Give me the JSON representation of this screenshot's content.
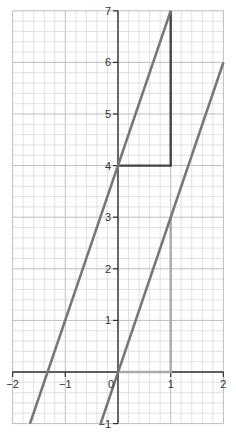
{
  "chart_data": {
    "type": "line",
    "title": "",
    "xlabel": "",
    "ylabel": "",
    "xlim": [
      -2,
      2
    ],
    "ylim": [
      -1,
      7
    ],
    "grid": true,
    "grid_minor_step": 0.2,
    "x_ticks": [
      -2,
      -1,
      0,
      1,
      2
    ],
    "x_tick_labels": [
      "-2",
      "-1",
      "0",
      "1",
      "2"
    ],
    "y_ticks": [
      -1,
      1,
      2,
      3,
      4,
      5,
      6,
      7
    ],
    "y_tick_labels": [
      "-1",
      "1",
      "2",
      "3",
      "4",
      "5",
      "6",
      "7"
    ],
    "series": [
      {
        "name": "y = 3x + 4",
        "slope": 3,
        "intercept": 4,
        "x": [
          -1.67,
          1
        ],
        "y": [
          -1,
          7
        ],
        "color": "#777777"
      },
      {
        "name": "y = 3x",
        "slope": 3,
        "intercept": 0,
        "x": [
          -0.33,
          2
        ],
        "y": [
          -1,
          6
        ],
        "color": "#777777"
      }
    ],
    "shapes": [
      {
        "name": "slope-triangle-upper",
        "points": [
          [
            0,
            4
          ],
          [
            1,
            4
          ],
          [
            1,
            7
          ]
        ],
        "color": "#444444"
      },
      {
        "name": "slope-triangle-lower",
        "points": [
          [
            0,
            0
          ],
          [
            1,
            0
          ],
          [
            1,
            3
          ]
        ],
        "color": "#aaaaaa"
      }
    ]
  },
  "colors": {
    "grid": "#d4d4d4",
    "axis": "#333333",
    "line": "#777777",
    "triangle_dark": "#444444",
    "triangle_light": "#aaaaaa"
  }
}
